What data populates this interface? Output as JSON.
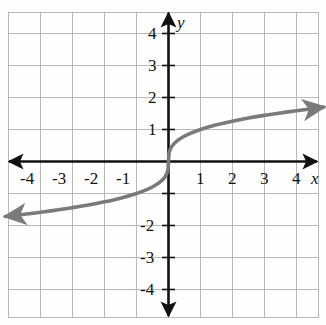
{
  "figure": {
    "kind": "cartesian-graph",
    "axis_labels": {
      "x": "x",
      "y": "y"
    },
    "colors": {
      "grid": "#b9b9b9",
      "axis": "#111111",
      "curve": "#7a7a7a",
      "background": "#fefefe",
      "text": "#111111"
    }
  },
  "chart_data": {
    "type": "line",
    "title": "",
    "xlabel": "x",
    "ylabel": "y",
    "xlim": [
      -5.0,
      4.9
    ],
    "ylim": [
      -4.65,
      4.65
    ],
    "grid": true,
    "legend": "none",
    "xticks": [
      -4,
      -3,
      -2,
      -1,
      1,
      2,
      3,
      4
    ],
    "xticklabels": [
      "-4",
      "-3",
      "-2",
      "-1",
      "1",
      "2",
      "3",
      "4"
    ],
    "yticks": [
      4,
      3,
      2,
      1,
      -2,
      -3,
      -4
    ],
    "yticklabels": [
      "4",
      "3",
      "2",
      "1",
      "-2",
      "-3",
      "-4"
    ],
    "series": [
      {
        "name": "cube-root curve",
        "equation": "y = cbrt(x)",
        "arrow_start": true,
        "arrow_end": true,
        "x": [
          -5.1,
          -4.5,
          -4.0,
          -3.5,
          -3.0,
          -2.5,
          -2.0,
          -1.5,
          -1.0,
          -0.7,
          -0.45,
          -0.25,
          -0.12,
          -0.05,
          -0.015,
          0,
          0.015,
          0.05,
          0.12,
          0.25,
          0.45,
          0.7,
          1.0,
          1.5,
          2.0,
          2.5,
          3.0,
          3.5,
          4.0,
          4.5,
          4.85
        ],
        "y": [
          -1.72,
          -1.65,
          -1.587,
          -1.518,
          -1.442,
          -1.357,
          -1.26,
          -1.145,
          -1.0,
          -0.888,
          -0.766,
          -0.63,
          -0.493,
          -0.368,
          -0.247,
          0,
          0.247,
          0.368,
          0.493,
          0.63,
          0.766,
          0.888,
          1.0,
          1.145,
          1.26,
          1.357,
          1.442,
          1.518,
          1.587,
          1.65,
          1.7
        ]
      }
    ]
  },
  "labels": {
    "x_axis_name": "x",
    "y_axis_name": "y",
    "x_neg": [
      "-4",
      "-3",
      "-2",
      "-1"
    ],
    "x_pos": [
      "1",
      "2",
      "3",
      "4"
    ],
    "y_pos": [
      "4",
      "3",
      "2",
      "1"
    ],
    "y_neg": [
      "-2",
      "-3",
      "-4"
    ]
  }
}
